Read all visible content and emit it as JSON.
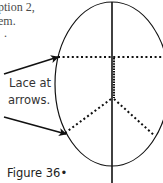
{
  "body_text": {
    "line1": "ption 2,",
    "line2": "em.",
    "line3": "."
  },
  "diagram": {
    "callout_line1": "Lace at",
    "callout_line2": "arrows.",
    "figure_label": "Figure 36•",
    "stroke_color": "#111111"
  }
}
